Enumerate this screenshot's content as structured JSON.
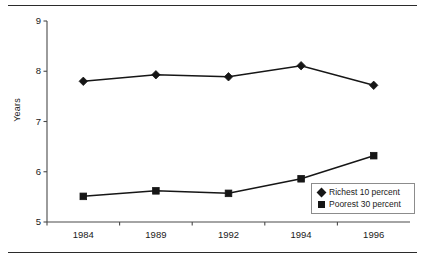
{
  "chart_data": {
    "type": "line",
    "title": "",
    "xlabel": "",
    "ylabel": "Years",
    "categories": [
      "1984",
      "1989",
      "1992",
      "1994",
      "1996"
    ],
    "ylim": [
      5,
      9
    ],
    "yticks": [
      "5",
      "6",
      "7",
      "8",
      "9"
    ],
    "grid": false,
    "legend_position": "inside-bottom-right",
    "series": [
      {
        "name": "Richest 10 percent",
        "marker": "diamond",
        "color": "#161616",
        "values": [
          7.8,
          7.93,
          7.89,
          8.11,
          7.72
        ]
      },
      {
        "name": "Poorest 30 percent",
        "marker": "square",
        "color": "#161616",
        "values": [
          5.51,
          5.62,
          5.57,
          5.86,
          6.32
        ]
      }
    ]
  },
  "figure": {
    "top_rule": "",
    "bottom_rule": ""
  }
}
